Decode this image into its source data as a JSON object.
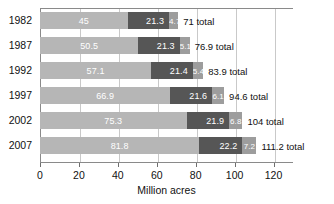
{
  "chart_data": {
    "type": "bar",
    "orientation": "horizontal",
    "stacked": true,
    "title": "",
    "xlabel": "Million acres",
    "ylabel": "",
    "xlim": [
      0,
      130
    ],
    "xticks": [
      0,
      20,
      40,
      60,
      80,
      100,
      120
    ],
    "grid": true,
    "legend": "none",
    "categories": [
      "1982",
      "1987",
      "1992",
      "1997",
      "2002",
      "2007"
    ],
    "series": [
      {
        "name": "segment-1",
        "color": "#b6b6b6",
        "values": [
          45,
          50.5,
          57.1,
          66.9,
          75.3,
          81.8
        ]
      },
      {
        "name": "segment-2",
        "color": "#565656",
        "values": [
          21.3,
          21.3,
          21.4,
          21.6,
          21.9,
          22.2
        ]
      },
      {
        "name": "segment-3",
        "color": "#9d9d9d",
        "values": [
          4.7,
          5.1,
          5.4,
          6.1,
          6.8,
          7.2
        ]
      }
    ],
    "totals": [
      71,
      76.9,
      83.9,
      94.6,
      104,
      111.2
    ],
    "rows": [
      {
        "year": "1982",
        "v1": "45",
        "v2": "21.3",
        "v3": "4.7",
        "total": "71 total"
      },
      {
        "year": "1987",
        "v1": "50.5",
        "v2": "21.3",
        "v3": "5.1",
        "total": "76.9 total"
      },
      {
        "year": "1992",
        "v1": "57.1",
        "v2": "21.4",
        "v3": "5.4",
        "total": "83.9 total"
      },
      {
        "year": "1997",
        "v1": "66.9",
        "v2": "21.6",
        "v3": "6.1",
        "total": "94.6 total"
      },
      {
        "year": "2002",
        "v1": "75.3",
        "v2": "21.9",
        "v3": "6.8",
        "total": "104 total"
      },
      {
        "year": "2007",
        "v1": "81.8",
        "v2": "22.2",
        "v3": "7.2",
        "total": "111.2 total"
      }
    ]
  },
  "axis": {
    "tick_labels": [
      "0",
      "20",
      "40",
      "60",
      "80",
      "100",
      "120"
    ],
    "title": "Million acres"
  },
  "colors": {
    "segment_1": "#b6b6b6",
    "segment_2": "#565656",
    "segment_3": "#9d9d9d",
    "frame": "#8a8a8a",
    "grid": "#c9c9c9",
    "text": "#111111",
    "value_text": "#ffffff"
  }
}
